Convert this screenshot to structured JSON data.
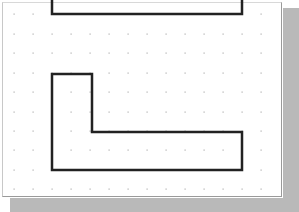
{
  "canvas": {
    "background": "#ffffff",
    "shadow_color": "#b9b9b9",
    "grid": {
      "dot_color": "#b0b0b0",
      "x": [
        14,
        33,
        52,
        71,
        90,
        109,
        128,
        147,
        166,
        185,
        204,
        223,
        242,
        261
      ],
      "y": [
        14,
        34,
        53,
        73,
        92,
        112,
        131,
        150,
        170,
        189
      ]
    }
  },
  "shapes": [
    {
      "name": "top-u-shape",
      "stroke": "#222222",
      "stroke_width": 2.5,
      "points": [
        [
          52,
          0
        ],
        [
          52,
          14
        ],
        [
          242,
          14
        ],
        [
          242,
          0
        ]
      ],
      "closed": false
    },
    {
      "name": "l-shape",
      "stroke": "#222222",
      "stroke_width": 2.5,
      "points": [
        [
          52,
          74
        ],
        [
          92,
          74
        ],
        [
          92,
          132
        ],
        [
          242,
          132
        ],
        [
          242,
          170
        ],
        [
          52,
          170
        ]
      ],
      "closed": true
    }
  ]
}
